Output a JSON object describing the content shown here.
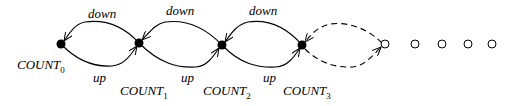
{
  "diagram": {
    "type": "state-transition",
    "states": [
      {
        "id": "COUNT0",
        "base": "COUNT",
        "sub": "0",
        "x": 61,
        "y": 44,
        "filled": true
      },
      {
        "id": "COUNT1",
        "base": "COUNT",
        "sub": "1",
        "x": 139,
        "y": 43,
        "filled": true
      },
      {
        "id": "COUNT2",
        "base": "COUNT",
        "sub": "2",
        "x": 222,
        "y": 45,
        "filled": true
      },
      {
        "id": "COUNT3",
        "base": "COUNT",
        "sub": "3",
        "x": 302,
        "y": 45,
        "filled": true
      }
    ],
    "continuation_nodes": [
      {
        "x": 385,
        "y": 44
      },
      {
        "x": 415,
        "y": 44
      },
      {
        "x": 442,
        "y": 44
      },
      {
        "x": 468,
        "y": 44
      },
      {
        "x": 492,
        "y": 44
      }
    ],
    "edges": [
      {
        "from": "COUNT1",
        "to": "COUNT0",
        "label": "down",
        "style": "solid"
      },
      {
        "from": "COUNT0",
        "to": "COUNT1",
        "label": "up",
        "style": "solid"
      },
      {
        "from": "COUNT2",
        "to": "COUNT1",
        "label": "down",
        "style": "solid"
      },
      {
        "from": "COUNT1",
        "to": "COUNT2",
        "label": "up",
        "style": "solid"
      },
      {
        "from": "COUNT3",
        "to": "COUNT2",
        "label": "down",
        "style": "solid"
      },
      {
        "from": "COUNT2",
        "to": "COUNT3",
        "label": "up",
        "style": "solid"
      },
      {
        "from": "next",
        "to": "COUNT3",
        "label": "",
        "style": "dashed"
      },
      {
        "from": "COUNT3",
        "to": "next",
        "label": "",
        "style": "dashed"
      }
    ],
    "labels": {
      "down": "down",
      "up": "up",
      "count": "COUNT",
      "sub0": "0",
      "sub1": "1",
      "sub2": "2",
      "sub3": "3"
    }
  }
}
